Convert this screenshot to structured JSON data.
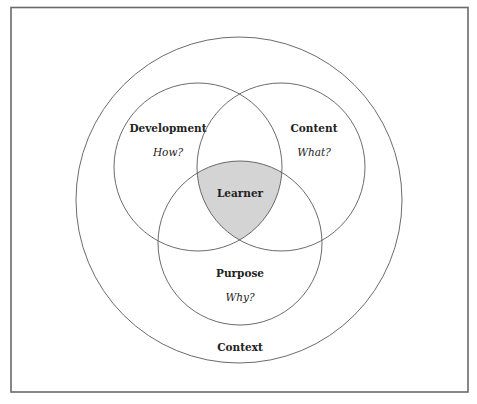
{
  "diagram": {
    "type": "venn",
    "frame": {
      "x": 11,
      "y": 7,
      "width": 457,
      "height": 385
    },
    "shade_color": "#d4d4d4",
    "line_color": "#5a5a5a",
    "outer": {
      "label": "Context",
      "cx": 239,
      "cy": 200,
      "r": 163
    },
    "circles": [
      {
        "id": "development",
        "label": "Development",
        "question": "How?",
        "cx": 198,
        "cy": 167,
        "r": 84
      },
      {
        "id": "content",
        "label": "Content",
        "question": "What?",
        "cx": 281,
        "cy": 167,
        "r": 84
      },
      {
        "id": "purpose",
        "label": "Purpose",
        "question": "Why?",
        "cx": 240,
        "cy": 243,
        "r": 82
      }
    ],
    "center": {
      "label": "Learner"
    }
  }
}
